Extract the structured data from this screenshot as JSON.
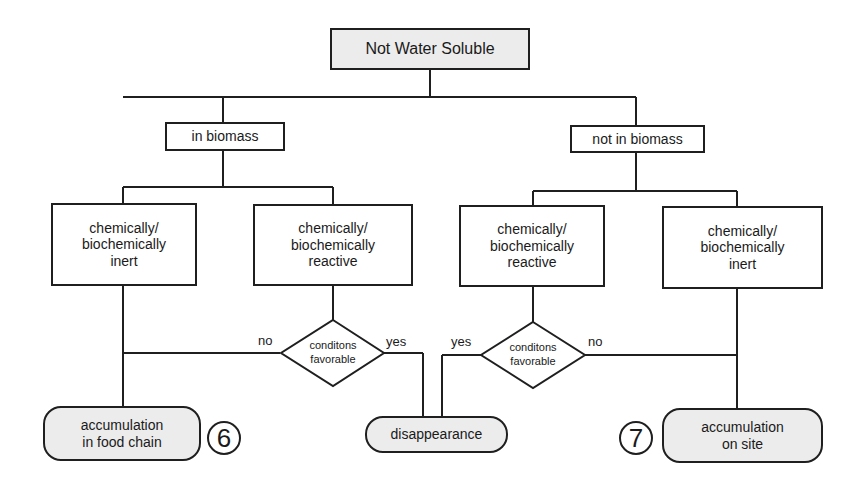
{
  "diagram": {
    "root": {
      "label": "Not Water Soluble"
    },
    "branches": [
      {
        "label": "in biomass",
        "children": [
          {
            "label": "chemically/\nbiochemically\ninert"
          },
          {
            "label": "chemically/\nbiochemically\nreactive"
          }
        ],
        "decision": {
          "label": "conditons\nfavorable",
          "no_label": "no",
          "yes_label": "yes"
        }
      },
      {
        "label": "not in biomass",
        "children": [
          {
            "label": "chemically/\nbiochemically\nreactive"
          },
          {
            "label": "chemically/\nbiochemically\ninert"
          }
        ],
        "decision": {
          "label": "conditons\nfavorable",
          "no_label": "no",
          "yes_label": "yes"
        }
      }
    ],
    "outcomes": [
      {
        "label": "accumulation\nin food chain",
        "marker": "6"
      },
      {
        "label": "disappearance"
      },
      {
        "label": "accumulation\non site",
        "marker": "7"
      }
    ]
  }
}
